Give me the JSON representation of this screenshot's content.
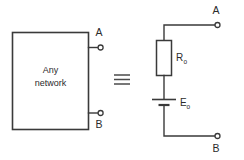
{
  "figure": {
    "background_color": "#ffffff",
    "line_color": "#3a3a3a",
    "text_color": "#2b2b2b"
  },
  "left_circuit": {
    "box_label_line1": "Any",
    "box_label_line2": "network",
    "terminal_top_label": "A",
    "terminal_bottom_label": "B"
  },
  "equivalence": {
    "symbol": "≡",
    "name": "identical-to-sign"
  },
  "right_circuit": {
    "resistor_label": "R",
    "resistor_subscript": "o",
    "source_label": "E",
    "source_subscript": "o",
    "terminal_top_label": "A",
    "terminal_bottom_label": "B"
  }
}
